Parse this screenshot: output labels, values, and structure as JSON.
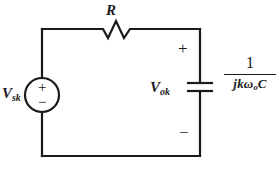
{
  "figure": {
    "name": "rc-series-circuit-diagram",
    "type": "schematic",
    "background_color": "#ffffff",
    "line_color": "#1a1a1a"
  },
  "components": {
    "resistor": {
      "label": "R",
      "symbol": "zigzag-resistor"
    },
    "source": {
      "label_main": "V",
      "label_sub": "sk",
      "symbol": "circle-voltage-source",
      "plus": "+",
      "minus": "−"
    },
    "capacitor": {
      "symbol": "parallel-plate-capacitor",
      "output_label_main": "V",
      "output_label_sub": "ok",
      "plus": "+",
      "minus": "−",
      "impedance": {
        "numerator": "1",
        "denominator_jk": "jk",
        "denominator_omega": "ω",
        "denominator_omega_sub": "o",
        "denominator_c": "C",
        "full": "1 / (jk ωₒ C)"
      }
    }
  }
}
